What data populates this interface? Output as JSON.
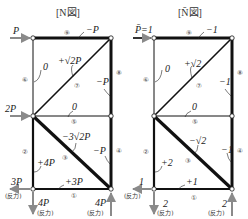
{
  "diagrams": [
    {
      "title": "[N図]",
      "load_top": "P",
      "load_mid": "2P",
      "members": {
        "m1": {
          "number": "①",
          "force": "+3P"
        },
        "m2": {
          "number": "②",
          "force": "+4P"
        },
        "m3": {
          "number": "③",
          "force": "−3√2P"
        },
        "m4": {
          "number": "④",
          "force": "−P"
        },
        "m5": {
          "number": "⑤",
          "force": "0"
        },
        "m6": {
          "number": "⑥",
          "force": "0"
        },
        "m7": {
          "number": "⑦",
          "force": "+√2P"
        },
        "m8": {
          "number": "⑧",
          "force": "−P"
        },
        "m9": {
          "number": "⑨",
          "force": "−P"
        }
      },
      "reactions": {
        "left_horizontal": "3P",
        "left_vertical": "4P",
        "right_vertical": "4P",
        "reaction_label": "(反力)"
      }
    },
    {
      "title": "[N̄図]",
      "load_top": "P̄=1",
      "members": {
        "m1": {
          "number": "①",
          "force": "+1"
        },
        "m2": {
          "number": "②",
          "force": "+2"
        },
        "m3": {
          "number": "③",
          "force": "−√2"
        },
        "m4": {
          "number": "④",
          "force": "−1"
        },
        "m5": {
          "number": "⑤",
          "force": "0"
        },
        "m6": {
          "number": "⑥",
          "force": "0"
        },
        "m7": {
          "number": "⑦",
          "force": "+√2"
        },
        "m8": {
          "number": "⑧",
          "force": "−1"
        },
        "m9": {
          "number": "⑨",
          "force": "−1"
        }
      },
      "reactions": {
        "left_horizontal": "1",
        "left_vertical": "2",
        "right_vertical": "2",
        "reaction_label": "(反力)"
      }
    }
  ],
  "colors": {
    "member": "#111111",
    "arrow": "#8a8a8a",
    "node_fill": "#ffffff"
  }
}
